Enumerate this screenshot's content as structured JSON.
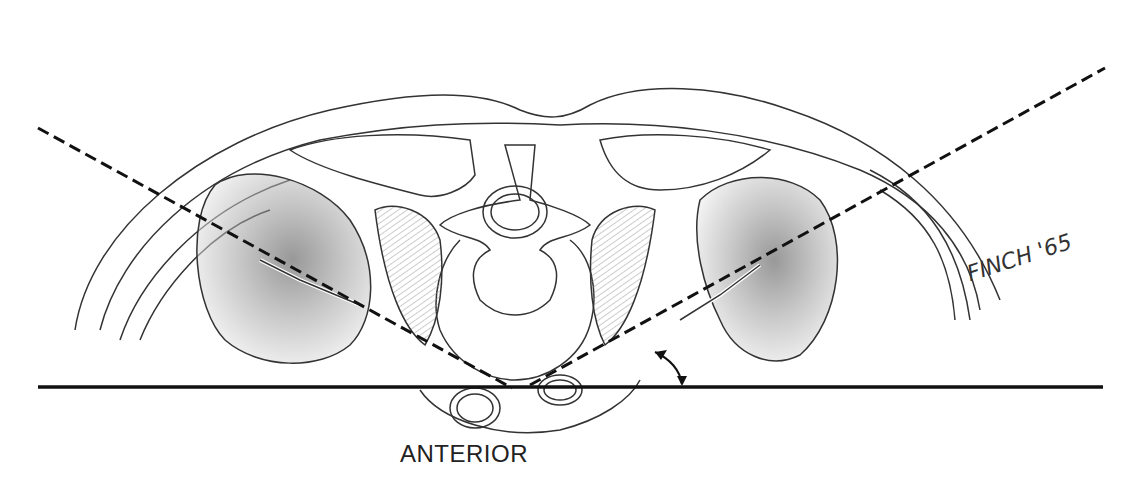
{
  "figure": {
    "orientation_label": "ANTERIOR",
    "signature": "FINCH '65",
    "elements": [
      "skin outline",
      "spine / vertebra",
      "spinal canal",
      "left kidney",
      "right kidney",
      "psoas muscles",
      "aorta",
      "vena cava",
      "kidney axis dashed lines",
      "horizontal reference line",
      "angle arrow"
    ],
    "colors": {
      "line": "#222222",
      "shade": "#888888",
      "background": "#ffffff"
    }
  }
}
